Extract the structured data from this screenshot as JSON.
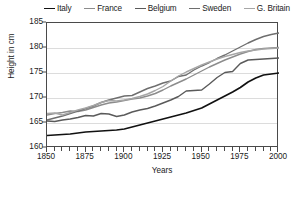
{
  "chart_data": {
    "type": "line",
    "title": "",
    "xlabel": "Years",
    "ylabel": "Height in cm",
    "xlim": [
      1850,
      2000
    ],
    "ylim": [
      160,
      185
    ],
    "xticks": [
      1850,
      1875,
      1900,
      1925,
      1950,
      1975,
      2000
    ],
    "yticks": [
      160,
      165,
      170,
      175,
      180,
      185
    ],
    "x_minor_step": 5,
    "grid": true,
    "legend_position": "top",
    "series": [
      {
        "name": "Italy",
        "color": "#111111",
        "x": [
          1850,
          1855,
          1860,
          1865,
          1870,
          1875,
          1880,
          1885,
          1890,
          1895,
          1900,
          1905,
          1910,
          1915,
          1920,
          1925,
          1930,
          1935,
          1940,
          1945,
          1950,
          1955,
          1960,
          1965,
          1970,
          1975,
          1980,
          1985,
          1990,
          1995,
          2000
        ],
        "values": [
          162.5,
          162.6,
          162.7,
          162.8,
          163.0,
          163.2,
          163.3,
          163.4,
          163.5,
          163.6,
          163.8,
          164.2,
          164.6,
          165.0,
          165.4,
          165.8,
          166.2,
          166.6,
          167.0,
          167.5,
          168.0,
          168.8,
          169.6,
          170.4,
          171.2,
          172.1,
          173.2,
          174.0,
          174.6,
          174.8,
          175.0
        ]
      },
      {
        "name": "France",
        "color": "#8c8c8c",
        "x": [
          1850,
          1855,
          1860,
          1865,
          1870,
          1875,
          1880,
          1885,
          1890,
          1895,
          1900,
          1905,
          1910,
          1915,
          1920,
          1925,
          1930,
          1935,
          1940,
          1945,
          1950,
          1955,
          1960,
          1965,
          1970,
          1975,
          1980,
          1985,
          1990,
          1995,
          2000
        ],
        "values": [
          166.6,
          166.9,
          167.1,
          167.4,
          167.3,
          167.6,
          168.1,
          168.6,
          169.0,
          169.2,
          169.5,
          169.8,
          170.0,
          170.4,
          170.9,
          171.6,
          172.4,
          173.1,
          173.8,
          174.6,
          175.4,
          176.2,
          176.9,
          177.6,
          178.2,
          178.8,
          179.3,
          179.7,
          179.9,
          180.0,
          180.1
        ]
      },
      {
        "name": "Belgium",
        "color": "#5a5a5a",
        "x": [
          1850,
          1855,
          1860,
          1865,
          1870,
          1875,
          1880,
          1885,
          1890,
          1895,
          1900,
          1905,
          1910,
          1915,
          1920,
          1925,
          1930,
          1935,
          1940,
          1945,
          1950,
          1955,
          1960,
          1965,
          1970,
          1975,
          1980,
          1985,
          1990,
          1995,
          2000
        ],
        "values": [
          165.4,
          165.3,
          165.6,
          165.8,
          166.1,
          166.5,
          166.4,
          166.9,
          166.8,
          166.3,
          166.6,
          167.2,
          167.6,
          167.9,
          168.4,
          169.0,
          169.6,
          170.3,
          171.4,
          171.5,
          171.6,
          172.8,
          174.1,
          175.1,
          175.3,
          176.9,
          177.6,
          177.7,
          177.8,
          177.9,
          178.0
        ]
      },
      {
        "name": "Sweden",
        "color": "#6e6e6e",
        "x": [
          1850,
          1855,
          1860,
          1865,
          1870,
          1875,
          1880,
          1885,
          1890,
          1895,
          1900,
          1905,
          1910,
          1915,
          1920,
          1925,
          1930,
          1935,
          1940,
          1945,
          1950,
          1955,
          1960,
          1965,
          1970,
          1975,
          1980,
          1985,
          1990,
          1995,
          2000
        ],
        "values": [
          165.6,
          166.0,
          166.4,
          166.9,
          167.4,
          167.9,
          168.4,
          169.1,
          169.6,
          170.0,
          170.4,
          170.5,
          171.2,
          171.9,
          172.4,
          173.0,
          173.4,
          174.3,
          174.6,
          175.6,
          176.4,
          177.1,
          177.9,
          178.6,
          179.4,
          180.2,
          181.0,
          181.7,
          182.3,
          182.7,
          183.0
        ]
      },
      {
        "name": "G. Britain",
        "color": "#a6a6a6",
        "x": [
          1850,
          1855,
          1860,
          1865,
          1870,
          1875,
          1880,
          1885,
          1890,
          1895,
          1900,
          1905,
          1910,
          1915,
          1920,
          1925,
          1930,
          1935,
          1940,
          1945,
          1950,
          1955,
          1960,
          1965,
          1970,
          1975,
          1980,
          1985,
          1990,
          1995,
          2000
        ],
        "values": [
          166.9,
          167.0,
          166.6,
          167.1,
          167.6,
          168.0,
          168.5,
          169.1,
          169.5,
          169.4,
          169.6,
          169.9,
          170.3,
          170.8,
          171.5,
          172.3,
          173.4,
          174.4,
          175.2,
          175.9,
          176.6,
          177.2,
          177.8,
          178.3,
          178.7,
          179.1,
          179.4,
          179.6,
          179.8,
          179.9,
          180.0
        ]
      }
    ]
  },
  "legend": {
    "items": [
      {
        "label": "Italy",
        "color": "#111111"
      },
      {
        "label": "France",
        "color": "#8c8c8c"
      },
      {
        "label": "Belgium",
        "color": "#5a5a5a"
      },
      {
        "label": "Sweden",
        "color": "#6e6e6e"
      },
      {
        "label": "G. Britain",
        "color": "#a6a6a6"
      }
    ]
  },
  "axes": {
    "y_title": "Height in cm",
    "x_title": "Years",
    "y_labels": [
      "185",
      "180",
      "175",
      "170",
      "165",
      "160"
    ],
    "x_labels": [
      "1850",
      "1875",
      "1900",
      "1925",
      "1950",
      "1975",
      "2000"
    ]
  }
}
